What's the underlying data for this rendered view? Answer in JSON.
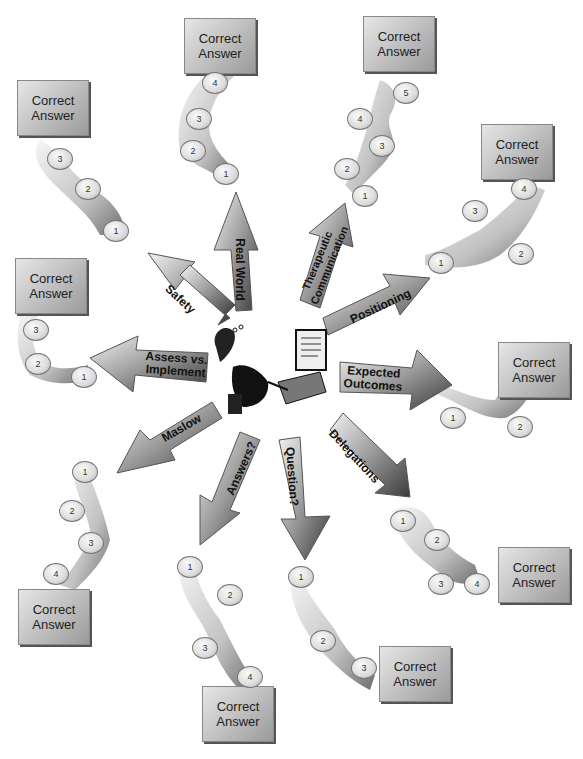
{
  "diagram": {
    "center": {
      "figure": "frustrated test-taker at computer"
    },
    "answer_label_line1": "Correct",
    "answer_label_line2": "Answer",
    "branches": [
      {
        "id": "safety",
        "label": "Safety",
        "steps": [
          "1",
          "2",
          "3"
        ]
      },
      {
        "id": "real-world",
        "label": "Real World",
        "steps": [
          "1",
          "2",
          "3",
          "4"
        ]
      },
      {
        "id": "therapeutic",
        "label_line1": "Therapeutic",
        "label_line2": "Communication",
        "steps": [
          "1",
          "2",
          "3",
          "4",
          "5"
        ]
      },
      {
        "id": "positioning",
        "label": "Positioning",
        "steps": [
          "1",
          "2",
          "3",
          "4"
        ]
      },
      {
        "id": "expected-outcomes",
        "label_line1": "Expected",
        "label_line2": "Outcomes",
        "steps": [
          "1",
          "2"
        ]
      },
      {
        "id": "delegations",
        "label": "Delegations",
        "steps": [
          "1",
          "2",
          "3",
          "4"
        ]
      },
      {
        "id": "question",
        "label": "Question?",
        "steps": [
          "1",
          "2",
          "3"
        ]
      },
      {
        "id": "answers",
        "label": "Answers?",
        "steps": [
          "1",
          "2",
          "3",
          "4"
        ]
      },
      {
        "id": "maslow",
        "label": "Maslow",
        "steps": [
          "1",
          "2",
          "3",
          "4"
        ]
      },
      {
        "id": "assess",
        "label_line1": "Assess vs.",
        "label_line2": "Implement",
        "steps": [
          "1",
          "2",
          "3"
        ]
      }
    ]
  }
}
